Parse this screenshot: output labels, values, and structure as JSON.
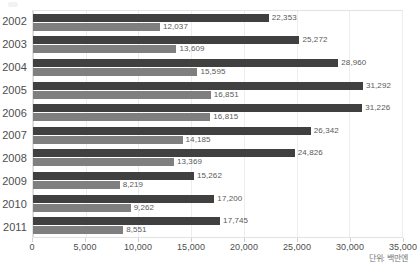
{
  "chart_data": {
    "type": "bar",
    "orientation": "horizontal",
    "title": "",
    "subtitle": "",
    "xlabel": "",
    "ylabel": "",
    "xlim": [
      0,
      35000
    ],
    "xticks": [
      "0",
      "5,000",
      "10,000",
      "15,000",
      "20,000",
      "25,000",
      "30,000",
      "35,000"
    ],
    "xtick_values": [
      0,
      5000,
      10000,
      15000,
      20000,
      25000,
      30000,
      35000
    ],
    "grid": true,
    "legend": "none",
    "categories": [
      "2002",
      "2003",
      "2004",
      "2005",
      "2006",
      "2007",
      "2008",
      "2009",
      "2010",
      "2011"
    ],
    "series": [
      {
        "name": "series-1",
        "color": "#404040",
        "values": [
          22353,
          25272,
          28960,
          31292,
          31226,
          26342,
          24826,
          15262,
          17200,
          17745
        ],
        "labels": [
          "22,353",
          "25,272",
          "28,960",
          "31,292",
          "31,226",
          "26,342",
          "24,826",
          "15,262",
          "17,200",
          "17,745"
        ]
      },
      {
        "name": "series-2",
        "color": "#7f7f7f",
        "values": [
          12037,
          13609,
          15595,
          16851,
          16815,
          14185,
          13369,
          8219,
          9262,
          8551
        ],
        "labels": [
          "12,037",
          "13,609",
          "15,595",
          "16,851",
          "16,815",
          "14,185",
          "13,369",
          "8,219",
          "9,262",
          "8,551"
        ]
      }
    ],
    "annotation": "단위: 백만엔"
  }
}
